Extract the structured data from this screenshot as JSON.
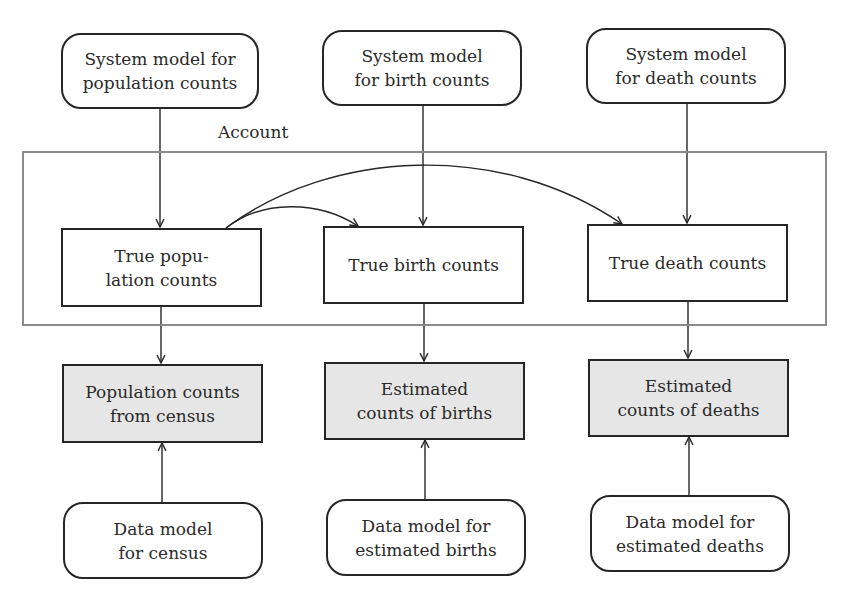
{
  "diagram": {
    "account_label": "Account",
    "system_models": {
      "population": "System model for\npopulation counts",
      "births": "System model\nfor birth counts",
      "deaths": "System model\nfor death counts"
    },
    "true_counts": {
      "population": "True popu-\nlation counts",
      "births": "True birth counts",
      "deaths": "True death counts"
    },
    "observed_data": {
      "population": "Population counts\nfrom census",
      "births": "Estimated\ncounts of births",
      "deaths": "Estimated\ncounts of deaths"
    },
    "data_models": {
      "population": "Data model\nfor census",
      "births": "Data model for\nestimated births",
      "deaths": "Data model for\nestimated deaths"
    },
    "colors": {
      "line": "#262626",
      "account_frame": "#8a8a8a",
      "observed_fill": "#e6e6e6",
      "background": "#ffffff"
    },
    "edges": [
      {
        "from": "System model for population counts",
        "to": "True population counts"
      },
      {
        "from": "System model for birth counts",
        "to": "True birth counts"
      },
      {
        "from": "System model for death counts",
        "to": "True death counts"
      },
      {
        "from": "True population counts",
        "to": "True birth counts",
        "style": "curved"
      },
      {
        "from": "True population counts",
        "to": "True death counts",
        "style": "curved"
      },
      {
        "from": "True population counts",
        "to": "Population counts from census"
      },
      {
        "from": "True birth counts",
        "to": "Estimated counts of births"
      },
      {
        "from": "True death counts",
        "to": "Estimated counts of deaths"
      },
      {
        "from": "Data model for census",
        "to": "Population counts from census"
      },
      {
        "from": "Data model for estimated births",
        "to": "Estimated counts of births"
      },
      {
        "from": "Data model for estimated deaths",
        "to": "Estimated counts of deaths"
      }
    ]
  }
}
